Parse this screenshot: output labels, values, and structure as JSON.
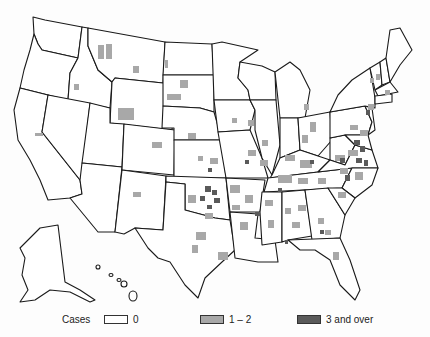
{
  "map": {
    "region": "United States (contiguous, Alaska, Hawaii)",
    "unit": "county",
    "colors": {
      "zero": "#ffffff",
      "low": "#a8a8a8",
      "high": "#5a5a5a",
      "outline": "#1a1a1a"
    }
  },
  "legend": {
    "title": "Cases",
    "items": [
      {
        "label": "0",
        "color": "#ffffff"
      },
      {
        "label": "1 – 2",
        "color": "#a8a8a8"
      },
      {
        "label": "3 and over",
        "color": "#5a5a5a"
      }
    ]
  }
}
